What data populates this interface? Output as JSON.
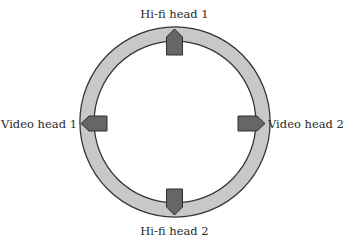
{
  "diagram": {
    "title": "",
    "ring": {
      "name": "head-drum",
      "fill": "#c8c8c8",
      "stroke": "#333333"
    },
    "heads": [
      {
        "id": "hifi-head-1",
        "label": "Hi-fi head 1",
        "position": "top"
      },
      {
        "id": "video-head-1",
        "label": "Video head 1",
        "position": "left"
      },
      {
        "id": "video-head-2",
        "label": "Video head 2",
        "position": "right"
      },
      {
        "id": "hifi-head-2",
        "label": "Hi-fi head 2",
        "position": "bottom"
      }
    ],
    "colors": {
      "head_fill": "#666666",
      "head_stroke": "#2e2e2e",
      "label": "#2a2a2a"
    }
  }
}
